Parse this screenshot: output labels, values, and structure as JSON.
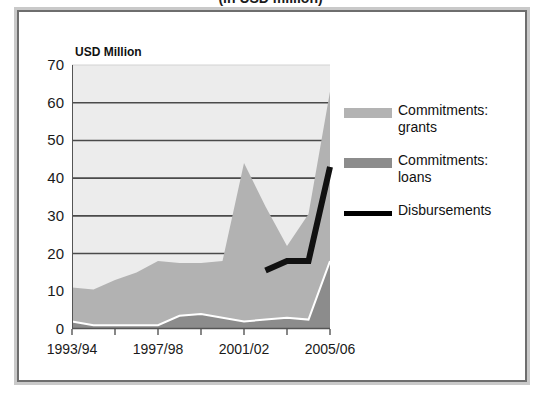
{
  "title": "(in USD million)",
  "axis_note": "USD Million",
  "legend": {
    "items": [
      {
        "label": "Commitments: grants",
        "color": "#b3b3b3",
        "type": "area"
      },
      {
        "label": "Commitments: loans",
        "color": "#8c8c8c",
        "type": "area"
      },
      {
        "label": "Disbursements",
        "color": "#000000",
        "type": "line"
      }
    ]
  },
  "chart_data": {
    "type": "area",
    "title": "(in USD million)",
    "subtitle": "",
    "xlabel": "",
    "ylabel": "USD Million",
    "ylim": [
      0,
      70
    ],
    "yticks": [
      0,
      10,
      20,
      30,
      40,
      50,
      60,
      70
    ],
    "ytick_labels": [
      "0",
      "10",
      "20",
      "30",
      "40",
      "50",
      "60",
      "70"
    ],
    "grid": true,
    "legend_position": "right",
    "stacked": true,
    "x": [
      "1993/94",
      "1994/95",
      "1995/96",
      "1996/97",
      "1997/98",
      "1998/99",
      "1999/00",
      "2000/01",
      "2001/02",
      "2002/03",
      "2003/04",
      "2004/05",
      "2005/06"
    ],
    "xtick_labels": [
      "1993/94",
      "1997/98",
      "2001/02",
      "2005/06"
    ],
    "xtick_label_indices": [
      0,
      4,
      8,
      12
    ],
    "series": [
      {
        "name": "Commitments: loans",
        "color": "#8c8c8c",
        "values": [
          2.0,
          1.0,
          1.0,
          1.0,
          1.0,
          3.5,
          4.0,
          3.0,
          2.0,
          2.5,
          3.0,
          2.5,
          18.0
        ]
      },
      {
        "name": "Commitments: grants",
        "color": "#b3b3b3",
        "values": [
          9.0,
          9.5,
          12.0,
          14.0,
          17.0,
          14.0,
          13.5,
          15.0,
          42.0,
          30.0,
          19.0,
          28.0,
          45.0
        ]
      },
      {
        "name": "Disbursements",
        "color": "#000000",
        "type": "line",
        "values": [
          null,
          null,
          null,
          null,
          null,
          null,
          null,
          null,
          null,
          15.5,
          18.0,
          18.0,
          43.0
        ]
      }
    ],
    "series_totals": [
      11.0,
      10.5,
      13.0,
      15.0,
      18.0,
      17.5,
      17.5,
      18.0,
      44.0,
      32.5,
      22.0,
      30.5,
      63.0
    ]
  }
}
